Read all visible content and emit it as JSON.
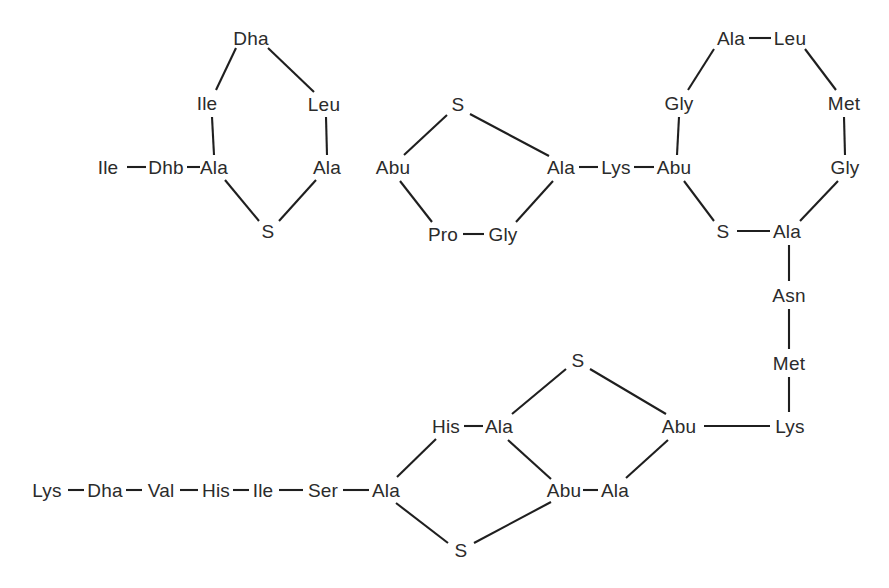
{
  "figure": {
    "type": "chemical-structure-diagram",
    "width": 889,
    "height": 588,
    "background_color": "#ffffff",
    "text_color": "#2b2b2b",
    "bond_color": "#1f1f1f",
    "bond_width": 2.1,
    "font_size_px": 19
  },
  "residues": [
    {
      "id": "r01",
      "label": "Ile",
      "x": 108,
      "y": 167
    },
    {
      "id": "r02",
      "label": "Dhb",
      "x": 166,
      "y": 167
    },
    {
      "id": "r03",
      "label": "Ala",
      "x": 214,
      "y": 167
    },
    {
      "id": "r04",
      "label": "Ile",
      "x": 207,
      "y": 103
    },
    {
      "id": "r05",
      "label": "Dha",
      "x": 251,
      "y": 38
    },
    {
      "id": "r06",
      "label": "Leu",
      "x": 324,
      "y": 104
    },
    {
      "id": "r07",
      "label": "Ala",
      "x": 327,
      "y": 167
    },
    {
      "id": "r08",
      "label": "S",
      "x": 268,
      "y": 231
    },
    {
      "id": "r09",
      "label": "Abu",
      "x": 393,
      "y": 167
    },
    {
      "id": "r10",
      "label": "S",
      "x": 458,
      "y": 104
    },
    {
      "id": "r11",
      "label": "Ala",
      "x": 561,
      "y": 167
    },
    {
      "id": "r12",
      "label": "Pro",
      "x": 443,
      "y": 234
    },
    {
      "id": "r13",
      "label": "Gly",
      "x": 503,
      "y": 234
    },
    {
      "id": "r14",
      "label": "Lys",
      "x": 616,
      "y": 167
    },
    {
      "id": "r15",
      "label": "Abu",
      "x": 674,
      "y": 167
    },
    {
      "id": "r16",
      "label": "Gly",
      "x": 679,
      "y": 103
    },
    {
      "id": "r17",
      "label": "Ala",
      "x": 731,
      "y": 38
    },
    {
      "id": "r18",
      "label": "Leu",
      "x": 790,
      "y": 38
    },
    {
      "id": "r19",
      "label": "Met",
      "x": 844,
      "y": 103
    },
    {
      "id": "r20",
      "label": "Gly",
      "x": 845,
      "y": 167
    },
    {
      "id": "r21",
      "label": "Ala",
      "x": 787,
      "y": 231
    },
    {
      "id": "r22",
      "label": "S",
      "x": 723,
      "y": 231
    },
    {
      "id": "r23",
      "label": "Asn",
      "x": 789,
      "y": 295
    },
    {
      "id": "r24",
      "label": "Met",
      "x": 789,
      "y": 363
    },
    {
      "id": "r25",
      "label": "Lys",
      "x": 790,
      "y": 426
    },
    {
      "id": "r26",
      "label": "Abu",
      "x": 679,
      "y": 426
    },
    {
      "id": "r27",
      "label": "S",
      "x": 578,
      "y": 360
    },
    {
      "id": "r28",
      "label": "Ala",
      "x": 499,
      "y": 426
    },
    {
      "id": "r29",
      "label": "His",
      "x": 446,
      "y": 426
    },
    {
      "id": "r30",
      "label": "Ala",
      "x": 615,
      "y": 490
    },
    {
      "id": "r31",
      "label": "Abu",
      "x": 564,
      "y": 490
    },
    {
      "id": "r32",
      "label": "S",
      "x": 461,
      "y": 550
    },
    {
      "id": "r33",
      "label": "Ala",
      "x": 386,
      "y": 490
    },
    {
      "id": "r34",
      "label": "Ser",
      "x": 323,
      "y": 490
    },
    {
      "id": "r35",
      "label": "Ile",
      "x": 263,
      "y": 490
    },
    {
      "id": "r36",
      "label": "His",
      "x": 216,
      "y": 490
    },
    {
      "id": "r37",
      "label": "Val",
      "x": 161,
      "y": 490
    },
    {
      "id": "r38",
      "label": "Dha",
      "x": 105,
      "y": 490
    },
    {
      "id": "r39",
      "label": "Lys",
      "x": 47,
      "y": 490
    }
  ],
  "bonds": [
    {
      "from": "Ile-N",
      "x1": 127,
      "y1": 167,
      "x2": 146,
      "y2": 167
    },
    {
      "from": "Dhb-Ala",
      "x1": 187,
      "y1": 167,
      "x2": 200,
      "y2": 167
    },
    {
      "from": "Ala-Ile",
      "x1": 214,
      "y1": 155,
      "x2": 212,
      "y2": 117
    },
    {
      "from": "Ile-Dha",
      "x1": 216,
      "y1": 90,
      "x2": 236,
      "y2": 48
    },
    {
      "from": "Dha-Leu",
      "x1": 268,
      "y1": 48,
      "x2": 314,
      "y2": 92
    },
    {
      "from": "Leu-Ala",
      "x1": 326,
      "y1": 117,
      "x2": 327,
      "y2": 155
    },
    {
      "from": "Ala-S",
      "x1": 225,
      "y1": 180,
      "x2": 259,
      "y2": 221
    },
    {
      "from": "S-Ala",
      "x1": 279,
      "y1": 221,
      "x2": 316,
      "y2": 180
    },
    {
      "from": "Abu-S",
      "x1": 404,
      "y1": 155,
      "x2": 447,
      "y2": 115
    },
    {
      "from": "S-Ala2",
      "x1": 470,
      "y1": 114,
      "x2": 549,
      "y2": 156
    },
    {
      "from": "Abu-Pro",
      "x1": 400,
      "y1": 181,
      "x2": 432,
      "y2": 222
    },
    {
      "from": "Pro-Gly",
      "x1": 463,
      "y1": 234,
      "x2": 484,
      "y2": 234
    },
    {
      "from": "Gly-Ala",
      "x1": 516,
      "y1": 222,
      "x2": 553,
      "y2": 181
    },
    {
      "from": "Ala-Lys",
      "x1": 579,
      "y1": 167,
      "x2": 598,
      "y2": 167
    },
    {
      "from": "Lys-Abu",
      "x1": 634,
      "y1": 167,
      "x2": 654,
      "y2": 167
    },
    {
      "from": "Abu-Gly",
      "x1": 677,
      "y1": 155,
      "x2": 679,
      "y2": 117
    },
    {
      "from": "Gly-Ala3",
      "x1": 688,
      "y1": 90,
      "x2": 714,
      "y2": 49
    },
    {
      "from": "Ala-Leu",
      "x1": 749,
      "y1": 38,
      "x2": 771,
      "y2": 38
    },
    {
      "from": "Leu-Met",
      "x1": 805,
      "y1": 49,
      "x2": 836,
      "y2": 90
    },
    {
      "from": "Met-Gly",
      "x1": 844,
      "y1": 117,
      "x2": 845,
      "y2": 155
    },
    {
      "from": "Gly-Ala4",
      "x1": 838,
      "y1": 181,
      "x2": 800,
      "y2": 221
    },
    {
      "from": "Ala-S3",
      "x1": 770,
      "y1": 231,
      "x2": 737,
      "y2": 231
    },
    {
      "from": "S-Abu",
      "x1": 714,
      "y1": 221,
      "x2": 684,
      "y2": 181
    },
    {
      "from": "Ala-Asn",
      "x1": 789,
      "y1": 245,
      "x2": 789,
      "y2": 281
    },
    {
      "from": "Asn-Met",
      "x1": 789,
      "y1": 309,
      "x2": 789,
      "y2": 349
    },
    {
      "from": "Met-Lys",
      "x1": 789,
      "y1": 377,
      "x2": 789,
      "y2": 412
    },
    {
      "from": "Lys-Abu2",
      "x1": 770,
      "y1": 426,
      "x2": 704,
      "y2": 426
    },
    {
      "from": "Abu-S4",
      "x1": 666,
      "y1": 414,
      "x2": 590,
      "y2": 369
    },
    {
      "from": "S-Ala5",
      "x1": 566,
      "y1": 369,
      "x2": 512,
      "y2": 414
    },
    {
      "from": "Ala-His",
      "x1": 483,
      "y1": 426,
      "x2": 464,
      "y2": 426
    },
    {
      "from": "Ala-Abu3",
      "x1": 508,
      "y1": 440,
      "x2": 551,
      "y2": 479
    },
    {
      "from": "Abu-Ala6",
      "x1": 583,
      "y1": 490,
      "x2": 598,
      "y2": 490
    },
    {
      "from": "Ala-Abu4",
      "x1": 626,
      "y1": 478,
      "x2": 668,
      "y2": 440
    },
    {
      "from": "Abu-S5",
      "x1": 551,
      "y1": 502,
      "x2": 474,
      "y2": 543
    },
    {
      "from": "S-Ala7",
      "x1": 448,
      "y1": 543,
      "x2": 396,
      "y2": 503
    },
    {
      "from": "His-Ala8",
      "x1": 436,
      "y1": 439,
      "x2": 397,
      "y2": 477
    },
    {
      "from": "Ala-Ser",
      "x1": 369,
      "y1": 490,
      "x2": 343,
      "y2": 490
    },
    {
      "from": "Ser-Ile",
      "x1": 303,
      "y1": 490,
      "x2": 279,
      "y2": 490
    },
    {
      "from": "Ile-His",
      "x1": 249,
      "y1": 490,
      "x2": 233,
      "y2": 490
    },
    {
      "from": "His-Val",
      "x1": 198,
      "y1": 490,
      "x2": 180,
      "y2": 490
    },
    {
      "from": "Val-Dha",
      "x1": 142,
      "y1": 490,
      "x2": 126,
      "y2": 490
    },
    {
      "from": "Dha-Lys",
      "x1": 84,
      "y1": 490,
      "x2": 68,
      "y2": 490
    }
  ]
}
